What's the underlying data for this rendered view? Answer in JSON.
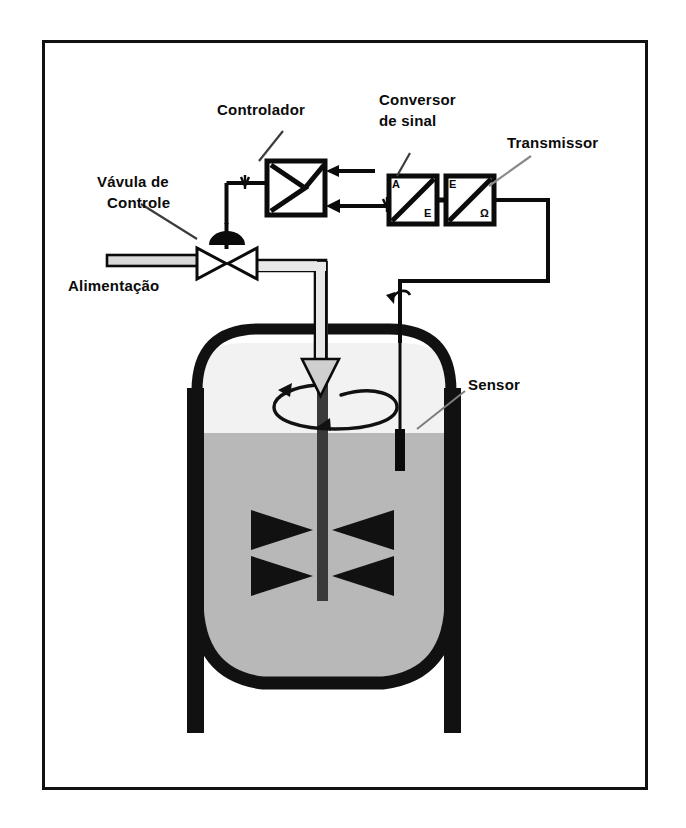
{
  "diagram": {
    "language": "pt-BR",
    "frame": {
      "stroke": "#111111",
      "background": "#ffffff"
    },
    "colors": {
      "outline": "#0b0b0b",
      "vessel_wall": "#111111",
      "liquid": "#b8b8b8",
      "vapor_space": "#f2f2f2",
      "pipe_fill": "#d9d9d9",
      "arrow_fill": "#cfcfcf",
      "page": "#ffffff"
    },
    "labels": {
      "controller": "Controlador",
      "signal_converter_line1": "Conversor",
      "signal_converter_line2": "de sinal",
      "transmitter": "Transmissor",
      "control_valve_line1": "Vávula de",
      "control_valve_line2": "Controle",
      "feed": "Alimentação",
      "sensor": "Sensor"
    },
    "components": [
      {
        "id": "controller",
        "name": "Controlador",
        "type": "controller-block",
        "symbol": "amplifier-triangle",
        "inputs": 2,
        "outputs": 1
      },
      {
        "id": "signal-converter",
        "name": "Conversor de sinal",
        "type": "converter-block",
        "input_label": "A",
        "output_label": "E"
      },
      {
        "id": "transmitter",
        "name": "Transmissor",
        "type": "converter-block",
        "input_label": "E",
        "output_label": "Ω"
      },
      {
        "id": "control-valve",
        "name": "Vávula de Controle",
        "type": "globe-valve",
        "actuator": "diaphragm"
      },
      {
        "id": "sensor",
        "name": "Sensor",
        "type": "level-probe"
      },
      {
        "id": "vessel",
        "name": "Tanque agitado",
        "type": "stirred-tank",
        "agitator": "dual-bowtie-impeller",
        "rotation_indicator": true
      },
      {
        "id": "feed-line",
        "name": "Alimentação",
        "type": "pipe"
      }
    ],
    "converter_boxes": {
      "converter": {
        "top_left": "A",
        "bottom_right": "E"
      },
      "transmitter": {
        "top_left": "E",
        "bottom_right": "Ω"
      }
    },
    "signal_markers": {
      "count": 3,
      "kind": "pneumatic-hatch"
    }
  }
}
